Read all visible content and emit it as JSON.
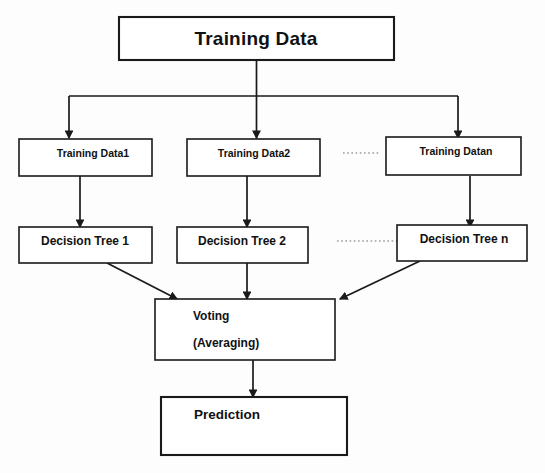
{
  "diagram": {
    "root": {
      "label": "Training Data"
    },
    "sample_row": {
      "boxes": [
        {
          "label": "Training Data1"
        },
        {
          "label": "Training Data2"
        },
        {
          "label": "Training Datan"
        }
      ],
      "ellipsis": "dotted-ellipsis"
    },
    "tree_row": {
      "boxes": [
        {
          "label": "Decision Tree 1"
        },
        {
          "label": "Decision Tree 2"
        },
        {
          "label": "Decision Tree n"
        }
      ],
      "ellipsis": "dotted-ellipsis"
    },
    "aggregate": {
      "line1": "Voting",
      "line2": "(Averaging)"
    },
    "output": {
      "label": "Prediction"
    },
    "colors": {
      "stroke": "#1a1a1a",
      "box_fill": "#ffffff",
      "background": "#fdfdfd",
      "dots": "#9a9a9a",
      "text": "#111111"
    }
  }
}
